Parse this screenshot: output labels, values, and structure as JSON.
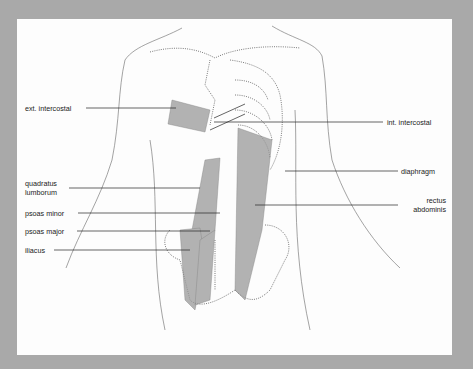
{
  "figure": {
    "labels_left": [
      {
        "id": "ext-intercostal",
        "text": "ext. intercostal"
      },
      {
        "id": "quadratus-lumborum",
        "line1": "quadratus",
        "line2": "lumborum"
      },
      {
        "id": "psoas-minor",
        "text": "psoas minor"
      },
      {
        "id": "psoas-major",
        "text": "psoas major"
      },
      {
        "id": "iliacus",
        "text": "iliacus"
      }
    ],
    "labels_right": [
      {
        "id": "int-intercostal",
        "text": "int. intercostal"
      },
      {
        "id": "diaphragm",
        "text": "diaphragm"
      },
      {
        "id": "rectus-abdominis",
        "line1": "rectus",
        "line2": "abdominis"
      }
    ]
  },
  "colors": {
    "background": "#a9a9a9",
    "panel": "#fdfdfd",
    "line": "#333333",
    "muscle": "#8a8a8a"
  }
}
